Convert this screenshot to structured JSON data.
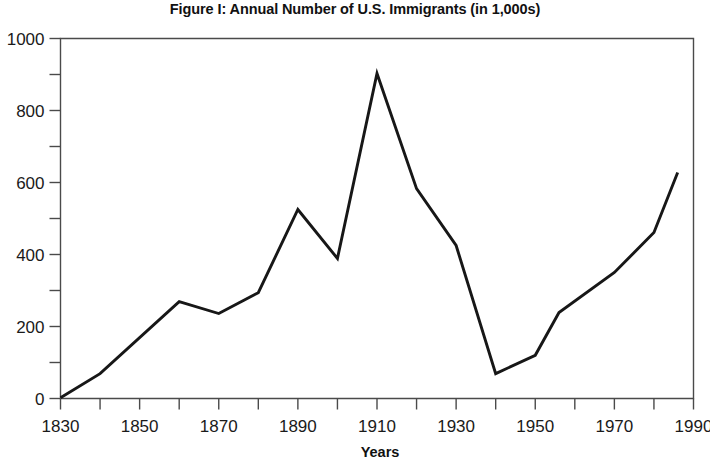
{
  "chart_data": {
    "type": "line",
    "title": "Figure I: Annual Number of U.S. Immigrants (in 1,000s)",
    "xlabel": "Years",
    "ylabel": "",
    "xlim": [
      1830,
      1990
    ],
    "ylim": [
      0,
      1000
    ],
    "grid": false,
    "legend": false,
    "x_tick_labels": [
      "1830",
      "1850",
      "1870",
      "1890",
      "1910",
      "1930",
      "1950",
      "1970",
      "1990"
    ],
    "x_major_ticks": [
      1830,
      1850,
      1870,
      1890,
      1910,
      1930,
      1950,
      1970,
      1990
    ],
    "x_minor_ticks": [
      1840,
      1860,
      1880,
      1900,
      1920,
      1940,
      1960,
      1980
    ],
    "y_tick_labels": [
      "0",
      "200",
      "400",
      "600",
      "800",
      "1000"
    ],
    "y_major_ticks": [
      0,
      200,
      400,
      600,
      800,
      1000
    ],
    "y_minor_ticks": [
      100,
      300,
      500,
      700,
      900
    ],
    "line_color": "#171717",
    "series": [
      {
        "name": "Annual Number of U.S. Immigrants (in 1,000s)",
        "x": [
          1830,
          1840,
          1860,
          1870,
          1880,
          1890,
          1900,
          1910,
          1920,
          1930,
          1940,
          1950,
          1956,
          1970,
          1980,
          1986
        ],
        "values": [
          2,
          69,
          269,
          236,
          294,
          525,
          389,
          903,
          583,
          425,
          69,
          120,
          239,
          350,
          461,
          628
        ]
      }
    ]
  }
}
